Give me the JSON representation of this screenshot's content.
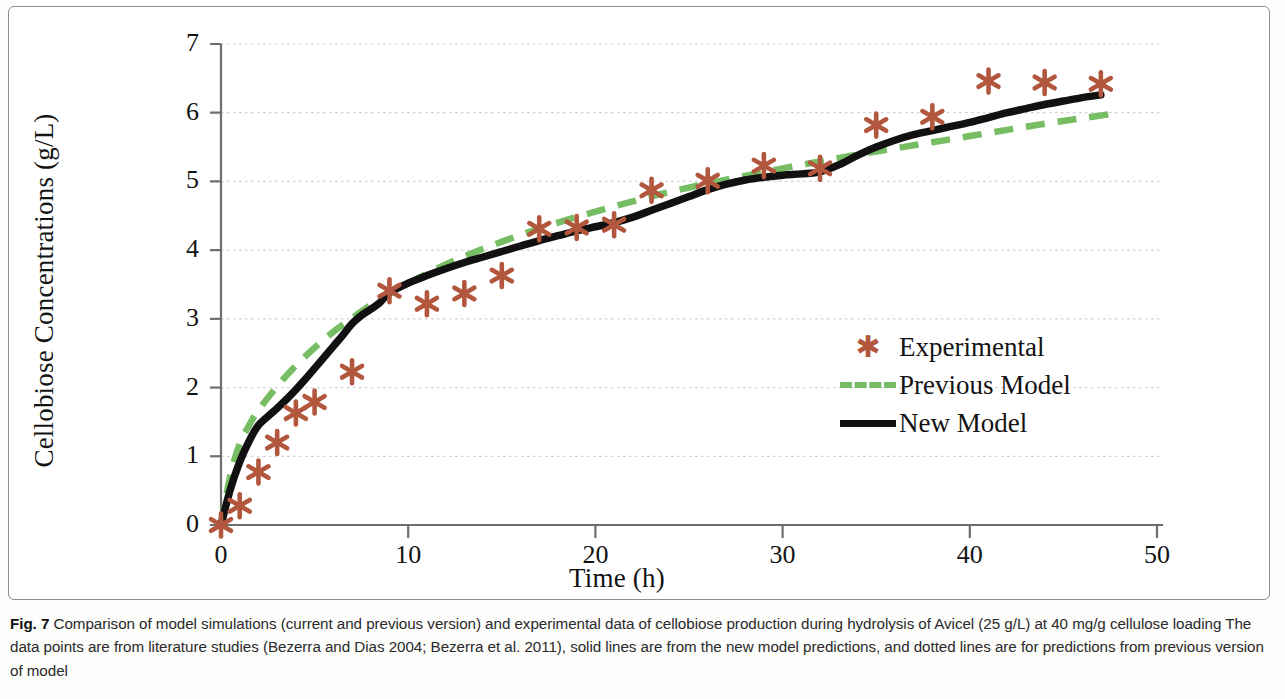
{
  "figure": {
    "number": "Fig. 7",
    "caption": "Comparison of model simulations (current and previous version) and experimental data of cellobiose production during hydrolysis of Avicel (25 g/L) at 40 mg/g cellulose loading The data points are from literature studies (Bezerra and Dias 2004; Bezerra et al. 2011), solid lines are from the new model predictions, and dotted lines are for predictions from previous version of model"
  },
  "colors": {
    "experimental_marker": "#b2573d",
    "previous_model_line": "#76bd63",
    "new_model_line": "#111111",
    "axis": "#6e6e6e",
    "gridline": "#cfcfcf",
    "frame": "#8d8d8d"
  },
  "legend": {
    "position": "inside-lower-right",
    "items": [
      {
        "label": "Experimental",
        "key": "asterisk-marker",
        "color": "#b2573d"
      },
      {
        "label": "Previous Model",
        "key": "dashed-line",
        "color": "#76bd63"
      },
      {
        "label": "New Model",
        "key": "solid-line",
        "color": "#111111"
      }
    ]
  },
  "chart_data": {
    "type": "scatter",
    "title": "",
    "xlabel": "Time (h)",
    "ylabel": "Cellobiose Concentrations (g/L)",
    "xlim": [
      0,
      50
    ],
    "ylim": [
      0,
      7
    ],
    "xticks": [
      0,
      10,
      20,
      30,
      40,
      50
    ],
    "yticks": [
      0,
      1,
      2,
      3,
      4,
      5,
      6,
      7
    ],
    "grid": "horizontal-dotted",
    "series": [
      {
        "name": "Experimental",
        "type": "scatter",
        "marker": "asterisk",
        "color": "#b2573d",
        "x": [
          0,
          1,
          2,
          3,
          4,
          5,
          7,
          9,
          11,
          13,
          15,
          17,
          19,
          21,
          23,
          26,
          29,
          32,
          35,
          38,
          41,
          44,
          47
        ],
        "y": [
          0,
          0.28,
          0.77,
          1.2,
          1.63,
          1.79,
          2.23,
          3.41,
          3.22,
          3.37,
          3.63,
          4.31,
          4.33,
          4.37,
          4.87,
          5.01,
          5.23,
          5.19,
          5.82,
          5.94,
          6.46,
          6.44,
          6.42
        ]
      },
      {
        "name": "Previous Model",
        "type": "line",
        "style": "dashed",
        "color": "#76bd63",
        "x": [
          0,
          0.5,
          1,
          1.5,
          2,
          3,
          4,
          5,
          6,
          7,
          8,
          9,
          10,
          12,
          14,
          16,
          18,
          20,
          22,
          24,
          26,
          28,
          30,
          32,
          34,
          36,
          38,
          40,
          42,
          44,
          46,
          48
        ],
        "y": [
          0,
          0.72,
          1.18,
          1.45,
          1.67,
          2.02,
          2.32,
          2.58,
          2.81,
          3.01,
          3.2,
          3.37,
          3.52,
          3.79,
          4.02,
          4.22,
          4.4,
          4.56,
          4.71,
          4.85,
          4.97,
          5.08,
          5.19,
          5.29,
          5.39,
          5.48,
          5.57,
          5.66,
          5.75,
          5.84,
          5.92,
          6.0
        ]
      },
      {
        "name": "New Model",
        "type": "line",
        "style": "solid",
        "color": "#111111",
        "x": [
          0,
          0.5,
          1,
          1.5,
          2,
          2.5,
          3,
          3.5,
          4,
          4.5,
          5,
          5.5,
          6,
          6.5,
          7,
          7.5,
          8,
          8.5,
          9,
          10,
          11,
          12,
          13,
          14,
          15,
          16,
          17,
          18,
          19,
          20,
          21,
          22,
          23,
          24,
          25,
          26,
          27,
          28,
          29,
          30,
          31,
          32,
          33,
          34,
          35,
          36,
          37,
          38,
          39,
          40,
          41,
          42,
          43,
          44,
          45,
          46,
          47
        ],
        "y": [
          0,
          0.52,
          0.92,
          1.22,
          1.45,
          1.58,
          1.7,
          1.83,
          1.97,
          2.12,
          2.28,
          2.44,
          2.6,
          2.76,
          2.93,
          3.05,
          3.14,
          3.24,
          3.38,
          3.52,
          3.63,
          3.73,
          3.82,
          3.9,
          3.98,
          4.06,
          4.14,
          4.21,
          4.28,
          4.34,
          4.4,
          4.48,
          4.58,
          4.68,
          4.78,
          4.88,
          4.96,
          5.02,
          5.06,
          5.09,
          5.11,
          5.14,
          5.24,
          5.38,
          5.5,
          5.6,
          5.68,
          5.74,
          5.8,
          5.86,
          5.93,
          6.0,
          6.06,
          6.12,
          6.17,
          6.22,
          6.26
        ]
      }
    ]
  }
}
